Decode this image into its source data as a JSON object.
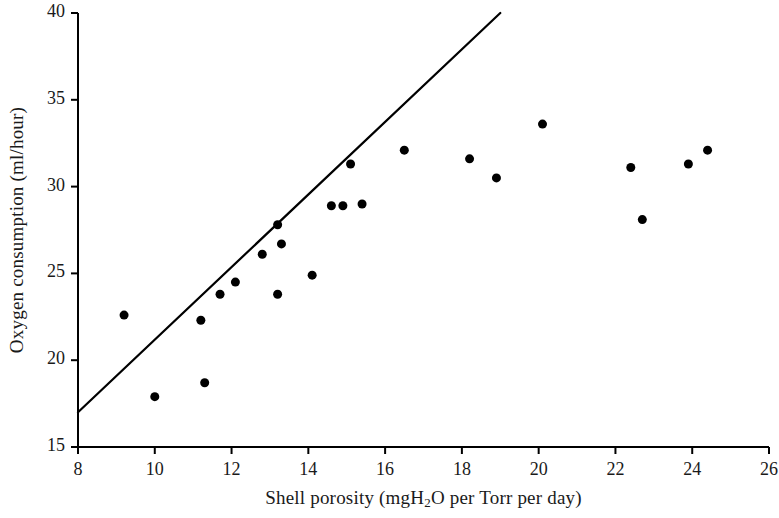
{
  "chart_data": {
    "type": "scatter",
    "title": "",
    "xlabel": "Shell porosity (mgH2O per Torr per day)",
    "xlabel_parts": {
      "pre": "Shell porosity (mgH",
      "sub": "2",
      "post": "O per Torr per day)"
    },
    "ylabel": "Oxygen consumption (ml/hour)",
    "xlim": [
      8,
      26
    ],
    "ylim": [
      15,
      40
    ],
    "xticks": [
      8,
      10,
      12,
      14,
      16,
      18,
      20,
      22,
      24,
      26
    ],
    "yticks": [
      15,
      20,
      25,
      30,
      35,
      40
    ],
    "grid": false,
    "legend": "none",
    "marker": {
      "shape": "circle",
      "color": "#000000",
      "size": 9
    },
    "points": [
      {
        "x": 9.2,
        "y": 22.6
      },
      {
        "x": 10.0,
        "y": 17.9
      },
      {
        "x": 11.2,
        "y": 22.3
      },
      {
        "x": 11.3,
        "y": 18.7
      },
      {
        "x": 11.7,
        "y": 23.8
      },
      {
        "x": 12.1,
        "y": 24.5
      },
      {
        "x": 12.8,
        "y": 26.1
      },
      {
        "x": 13.2,
        "y": 27.8
      },
      {
        "x": 13.3,
        "y": 26.7
      },
      {
        "x": 13.2,
        "y": 23.8
      },
      {
        "x": 14.1,
        "y": 24.9
      },
      {
        "x": 14.6,
        "y": 28.9
      },
      {
        "x": 14.9,
        "y": 28.9
      },
      {
        "x": 15.1,
        "y": 31.3
      },
      {
        "x": 15.4,
        "y": 29.0
      },
      {
        "x": 16.5,
        "y": 32.1
      },
      {
        "x": 18.2,
        "y": 31.6
      },
      {
        "x": 18.9,
        "y": 30.5
      },
      {
        "x": 20.1,
        "y": 33.6
      },
      {
        "x": 22.4,
        "y": 31.1
      },
      {
        "x": 22.7,
        "y": 28.1
      },
      {
        "x": 23.9,
        "y": 31.3
      },
      {
        "x": 24.4,
        "y": 32.1
      }
    ],
    "trend_line": {
      "label": "regression line",
      "x0": 8.0,
      "y0": 17.0,
      "x1": 19.0,
      "y1": 40.0,
      "color": "#000000",
      "width": 2.2
    },
    "axis_color": "#000000"
  }
}
